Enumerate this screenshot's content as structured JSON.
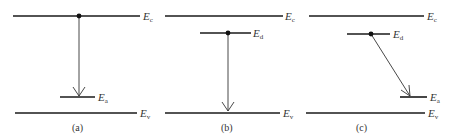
{
  "diagram": {
    "panels": [
      {
        "id": "a",
        "caption": "(a)",
        "levels": [
          {
            "name": "conduction-band",
            "symbol": "E",
            "subscript": "c",
            "x1": 13,
            "x2": 140,
            "y": 16
          },
          {
            "name": "acceptor-level",
            "symbol": "E",
            "subscript": "a",
            "x1": 60,
            "x2": 95,
            "y": 97
          },
          {
            "name": "valence-band",
            "symbol": "E",
            "subscript": "v",
            "x1": 15,
            "x2": 137,
            "y": 113
          }
        ],
        "electron": {
          "x": 79,
          "y": 16
        },
        "transition": {
          "from": "conduction-band",
          "to": "acceptor-level",
          "x1": 79,
          "y1": 16,
          "x2": 79,
          "y2": 97
        }
      },
      {
        "id": "b",
        "caption": "(b)",
        "levels": [
          {
            "name": "conduction-band",
            "symbol": "E",
            "subscript": "c",
            "x1": 165,
            "x2": 283,
            "y": 16
          },
          {
            "name": "donor-level",
            "symbol": "E",
            "subscript": "d",
            "x1": 200,
            "x2": 251,
            "y": 33
          },
          {
            "name": "valence-band",
            "symbol": "E",
            "subscript": "v",
            "x1": 165,
            "x2": 280,
            "y": 113
          }
        ],
        "electron": {
          "x": 228,
          "y": 33
        },
        "transition": {
          "from": "donor-level",
          "to": "valence-band",
          "x1": 228,
          "y1": 33,
          "x2": 228,
          "y2": 112
        }
      },
      {
        "id": "c",
        "caption": "(c)",
        "levels": [
          {
            "name": "conduction-band",
            "symbol": "E",
            "subscript": "c",
            "x1": 309,
            "x2": 424,
            "y": 16
          },
          {
            "name": "donor-level",
            "symbol": "E",
            "subscript": "d",
            "x1": 347,
            "x2": 390,
            "y": 34
          },
          {
            "name": "acceptor-level",
            "symbol": "E",
            "subscript": "a",
            "x1": 400,
            "x2": 427,
            "y": 97
          },
          {
            "name": "valence-band",
            "symbol": "E",
            "subscript": "v",
            "x1": 306,
            "x2": 425,
            "y": 113
          }
        ],
        "electron": {
          "x": 371,
          "y": 34
        },
        "transition": {
          "from": "donor-level",
          "to": "acceptor-level",
          "x1": 371,
          "y1": 34,
          "x2": 410,
          "y2": 97
        }
      }
    ],
    "colors": {
      "line": "#1a1a1a",
      "arrow": "#333333",
      "text": "#333333",
      "background": "#ffffff"
    }
  }
}
